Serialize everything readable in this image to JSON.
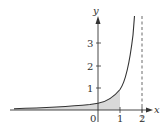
{
  "axes": {
    "x_label": "x",
    "y_label": "y",
    "x_ticks": [
      "0",
      "1",
      "2"
    ],
    "y_ticks": [
      "1",
      "2",
      "3"
    ]
  },
  "asymptote": {
    "x": 2,
    "style": "dashed"
  },
  "shaded_region": {
    "from": "-inf",
    "to": 1,
    "color": "#d8d8d8"
  },
  "colors": {
    "curve": "#333333",
    "axis": "#333333",
    "shade": "#d8d8d8"
  }
}
